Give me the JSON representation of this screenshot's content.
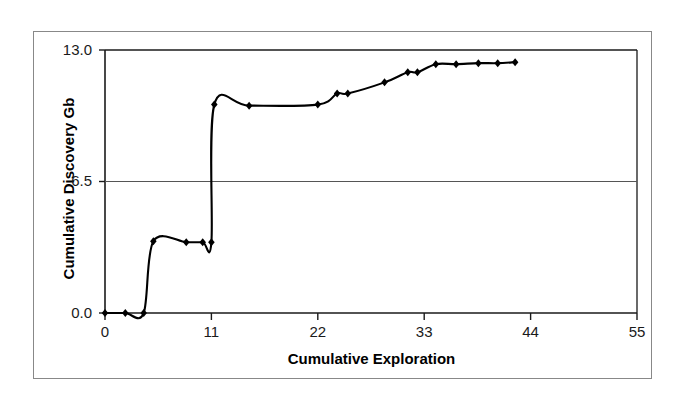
{
  "chart_data": {
    "type": "line",
    "title": "",
    "subtitle": "",
    "xlabel": "Cumulative Exploration",
    "ylabel": "Cumulative Discovery Gb",
    "xlim": [
      0,
      55
    ],
    "ylim": [
      0,
      13.0
    ],
    "xticks": [
      0,
      11,
      22,
      33,
      44,
      55
    ],
    "xtick_labels": [
      "0",
      "11",
      "22",
      "33",
      "44",
      "55"
    ],
    "yticks": [
      0.0,
      6.5,
      13.0
    ],
    "ytick_labels": [
      "0.0",
      "6.5",
      "13.0"
    ],
    "grid": "horizontal-only",
    "legend": "none",
    "marker": "diamond",
    "marker_color": "#000000",
    "line_color": "#000000",
    "line_smoothing": "spline",
    "series": [
      {
        "name": "Cumulative Discovery",
        "points": [
          {
            "x": 0.0,
            "y": 0.0
          },
          {
            "x": 2.1,
            "y": 0.0
          },
          {
            "x": 4.0,
            "y": 0.0
          },
          {
            "x": 5.0,
            "y": 3.55
          },
          {
            "x": 8.4,
            "y": 3.5
          },
          {
            "x": 10.1,
            "y": 3.5
          },
          {
            "x": 11.0,
            "y": 3.5
          },
          {
            "x": 11.3,
            "y": 10.3
          },
          {
            "x": 14.9,
            "y": 10.25
          },
          {
            "x": 22.0,
            "y": 10.3
          },
          {
            "x": 24.0,
            "y": 10.85
          },
          {
            "x": 25.1,
            "y": 10.85
          },
          {
            "x": 28.9,
            "y": 11.4
          },
          {
            "x": 31.3,
            "y": 11.9
          },
          {
            "x": 32.3,
            "y": 11.9
          },
          {
            "x": 34.2,
            "y": 12.3
          },
          {
            "x": 36.3,
            "y": 12.3
          },
          {
            "x": 38.6,
            "y": 12.35
          },
          {
            "x": 40.6,
            "y": 12.35
          },
          {
            "x": 42.4,
            "y": 12.4
          }
        ]
      }
    ]
  },
  "axes": {
    "y_title": "Cumulative Discovery Gb",
    "x_title": "Cumulative Exploration",
    "y_tick_0": "0.0",
    "y_tick_1": "6.5",
    "y_tick_2": "13.0",
    "x_tick_0": "0",
    "x_tick_1": "11",
    "x_tick_2": "22",
    "x_tick_3": "33",
    "x_tick_4": "44",
    "x_tick_5": "55"
  },
  "colors": {
    "line": "#000000",
    "marker": "#000000",
    "axis": "#1a1a1a",
    "grid": "#555555",
    "frame": "#888888",
    "background": "#ffffff"
  }
}
